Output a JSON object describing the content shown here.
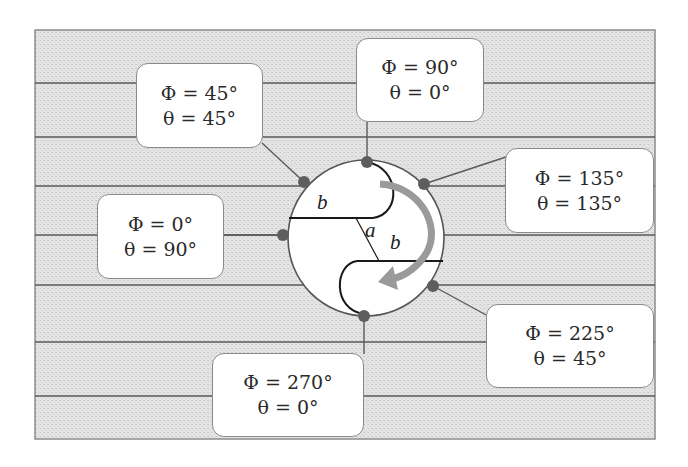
{
  "diagram": {
    "title": "",
    "colors": {
      "background_fill": "#e6e6e6",
      "frame_border": "#8c8c8c",
      "stripe_line": "#5a5a5a",
      "circle_fill": "#ffffff",
      "circle_stroke": "#555555",
      "dot_fill": "#5e5e5e",
      "arrow_fill": "#9a9a9a",
      "inner_line": "#1a1a1a",
      "box_border": "#8a8a8a"
    },
    "variables": {
      "b_upper": "b",
      "a": "a",
      "b_lower": "b"
    },
    "positions": [
      {
        "id": "phi-90",
        "phi": "Φ = 90°",
        "theta": "θ = 0°"
      },
      {
        "id": "phi-45",
        "phi": "Φ = 45°",
        "theta": "θ = 45°"
      },
      {
        "id": "phi-135",
        "phi": "Φ = 135°",
        "theta": "θ = 135°"
      },
      {
        "id": "phi-0",
        "phi": "Φ = 0°",
        "theta": "θ = 90°"
      },
      {
        "id": "phi-225",
        "phi": "Φ = 225°",
        "theta": "θ = 45°"
      },
      {
        "id": "phi-270",
        "phi": "Φ = 270°",
        "theta": "θ = 0°"
      }
    ]
  }
}
